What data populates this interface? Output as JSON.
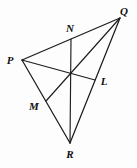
{
  "figure": {
    "background_color": "#fdfdfd",
    "line_color": "#1c1c1c",
    "label_color": "#101010",
    "width": 137,
    "height": 168,
    "vertices": [
      {
        "name": "P",
        "label": "P",
        "x": 22,
        "y": 60,
        "label_x": 10,
        "label_y": 60
      },
      {
        "name": "Q",
        "label": "Q",
        "x": 120,
        "y": 18,
        "label_x": 124,
        "label_y": 11
      },
      {
        "name": "R",
        "label": "R",
        "x": 70,
        "y": 143,
        "label_x": 70,
        "label_y": 154
      }
    ],
    "midpoints": [
      {
        "name": "N",
        "label": "N",
        "on_side": "PQ",
        "x": 71,
        "y": 39,
        "label_x": 70,
        "label_y": 28
      },
      {
        "name": "L",
        "label": "L",
        "on_side": "QR",
        "x": 95,
        "y": 80,
        "label_x": 104,
        "label_y": 81
      },
      {
        "name": "M",
        "label": "M",
        "on_side": "PR",
        "x": 46,
        "y": 101,
        "label_x": 34,
        "label_y": 106
      }
    ],
    "centroid": {
      "name": "centroid",
      "x": 70.6,
      "y": 73.6
    },
    "sides": [
      {
        "name": "side-PQ",
        "from": "P",
        "to": "Q",
        "path": "M 22 60 L 120 18"
      },
      {
        "name": "side-QR",
        "from": "Q",
        "to": "R",
        "path": "M 120 18 L 70 143"
      },
      {
        "name": "side-PR",
        "from": "P",
        "to": "R",
        "path": "M 22 60 L 70 143"
      }
    ],
    "medians": [
      {
        "name": "median-PL",
        "from": "P",
        "to": "L",
        "path": "M 22 60 L 95 80"
      },
      {
        "name": "median-QM",
        "from": "Q",
        "to": "M",
        "path": "M 120 18 L 46 101"
      },
      {
        "name": "median-NR",
        "from": "N",
        "to": "R",
        "path": "M 71 39 L 70 143"
      }
    ]
  }
}
